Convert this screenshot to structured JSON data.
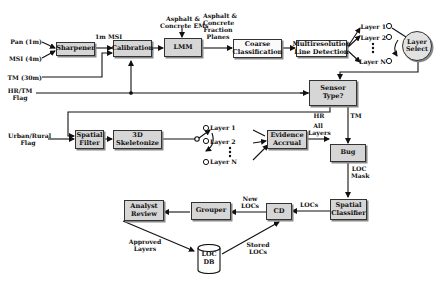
{
  "diagram": {
    "inputs": {
      "pan": "Pan (1m)",
      "msi": "MSI (4m)",
      "tm": "TM (30m)",
      "hrtm_flag_1": "HR/TM",
      "hrtm_flag_2": "Flag",
      "urban_flag_1": "Urban/Rural",
      "urban_flag_2": "Flag"
    },
    "blocks": {
      "sharpener": "Sharpener",
      "calibration": "Calibration",
      "lmm": "LMM",
      "coarse_classification_1": "Coarse",
      "coarse_classification_2": "Classification",
      "line_detection_1": "Multiresolution",
      "line_detection_2": "Line Detection",
      "layer_select_1": "Layer",
      "layer_select_2": "Select",
      "sensor_type_1": "Sensor",
      "sensor_type_2": "Type?",
      "spatial_filter_1": "Spatial",
      "spatial_filter_2": "Filter",
      "skeletonize_1": "3D",
      "skeletonize_2": "Skeletonize",
      "evidence_accrual_1": "Evidence",
      "evidence_accrual_2": "Accrual",
      "bug": "Bug",
      "spatial_classifier_1": "Spatial",
      "spatial_classifier_2": "Classifier",
      "cd": "CD",
      "grouper": "Grouper",
      "analyst_review_1": "Analyst",
      "analyst_review_2": "Review",
      "loc_db_1": "LOC",
      "loc_db_2": "DB"
    },
    "edge_labels": {
      "msi_1m": "1m MSI",
      "asphalt_ems_1": "Asphalt &",
      "asphalt_ems_2": "Concrete EMs",
      "fraction_planes_1": "Asphalt &",
      "fraction_planes_2": "Concrete",
      "fraction_planes_3": "Fraction",
      "fraction_planes_4": "Planes",
      "hr": "HR",
      "tm": "TM",
      "all_layers_1": "All",
      "all_layers_2": "Layers",
      "loc_mask_1": "LOC",
      "loc_mask_2": "Mask",
      "locs": "LOCs",
      "new_locs_1": "New",
      "new_locs_2": "LOCs",
      "approved_layers_1": "Approved",
      "approved_layers_2": "Layers",
      "stored_locs_1": "Stored",
      "stored_locs_2": "LOCs"
    },
    "layers_top": [
      "Layer 1",
      "Layer 2",
      "Layer N"
    ],
    "layers_mid": [
      "Layer 1",
      "Layer 2",
      "Layer N"
    ]
  }
}
